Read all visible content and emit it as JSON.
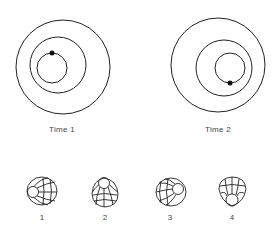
{
  "panels": [
    {
      "label": "Time 1",
      "circles": [
        {
          "cx": 63,
          "cy": 67,
          "r": 47
        },
        {
          "cx": 58,
          "cy": 65,
          "r": 28
        },
        {
          "cx": 52,
          "cy": 68,
          "r": 15
        }
      ],
      "dot": {
        "cx": 52,
        "cy": 53,
        "r": 2.5
      }
    },
    {
      "label": "Time 2",
      "circles": [
        {
          "cx": 218,
          "cy": 65,
          "r": 47
        },
        {
          "cx": 224,
          "cy": 68,
          "r": 28
        },
        {
          "cx": 230,
          "cy": 68,
          "r": 15
        }
      ],
      "dot": {
        "cx": 230,
        "cy": 83,
        "r": 2.5
      }
    }
  ],
  "figures": [
    {
      "number": "1",
      "description": "sphere-like net viewed with small circle on left"
    },
    {
      "number": "2",
      "description": "sphere-like net viewed with small circle on top"
    },
    {
      "number": "3",
      "description": "sphere-like net viewed with small circle on right"
    },
    {
      "number": "4",
      "description": "sphere-like net viewed with small circle on bottom"
    }
  ],
  "colors": {
    "stroke": "#222222",
    "text": "#444444",
    "background": "#ffffff"
  }
}
